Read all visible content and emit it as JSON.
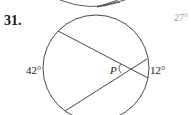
{
  "problem": {
    "number": "31.",
    "labels": {
      "left_arc": "42°",
      "right_arc": "12°",
      "point": "P",
      "margin_value": "27°"
    }
  },
  "figure": {
    "type": "circle with two intersecting secants/chords",
    "stroke_color": "#333333"
  }
}
